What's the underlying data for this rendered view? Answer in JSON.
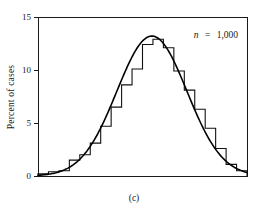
{
  "figure": {
    "caption": "(c)",
    "annotation": {
      "symbol": "n",
      "equals": "=",
      "value": "1,000",
      "full": "n = 1,000"
    }
  },
  "chart_data": {
    "type": "bar",
    "title": "",
    "subtitle": "",
    "xlabel": "",
    "ylabel": "Percent of cases",
    "ylim": [
      0,
      15
    ],
    "xlim": [
      0,
      20
    ],
    "grid": false,
    "legend": null,
    "annotations": [
      "n = 1,000"
    ],
    "ytick_labels": [
      "0",
      "5",
      "10",
      "15"
    ],
    "ytick_values": [
      0,
      5,
      10,
      15
    ],
    "xtick_labels": [],
    "xtick_values": [],
    "bin_count": 20,
    "categories": [
      "1",
      "2",
      "3",
      "4",
      "5",
      "6",
      "7",
      "8",
      "9",
      "10",
      "11",
      "12",
      "13",
      "14",
      "15",
      "16",
      "17",
      "18",
      "19",
      "20"
    ],
    "values": [
      0.2,
      0.4,
      0.5,
      1.5,
      2.0,
      3.1,
      4.7,
      6.5,
      8.6,
      10.1,
      12.4,
      12.9,
      12.1,
      9.9,
      8.1,
      6.3,
      4.5,
      2.6,
      1.1,
      0.5
    ],
    "series": [
      {
        "name": "Percent of cases (histogram)",
        "type": "bar",
        "values": [
          0.2,
          0.4,
          0.5,
          1.5,
          2.0,
          3.1,
          4.7,
          6.5,
          8.6,
          10.1,
          12.4,
          12.9,
          12.1,
          9.9,
          8.1,
          6.3,
          4.5,
          2.6,
          1.1,
          0.5
        ]
      },
      {
        "name": "Normal curve overlay",
        "type": "line",
        "peak_value": 13.2,
        "peak_x": 10.9,
        "std_dev_bins": 3.35,
        "values": [
          0.15,
          0.45,
          1.0,
          1.9,
          3.3,
          5.1,
          7.2,
          9.2,
          11.1,
          12.5,
          13.1,
          12.9,
          11.9,
          10.3,
          8.4,
          6.4,
          4.5,
          2.9,
          1.7,
          0.8
        ]
      }
    ]
  }
}
